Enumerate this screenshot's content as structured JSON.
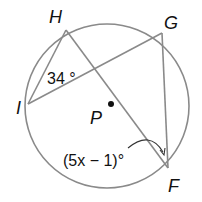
{
  "diagram": {
    "type": "circle-inscribed-angles",
    "circle": {
      "center": "P",
      "cx": 107,
      "cy": 106,
      "r": 82
    },
    "points": {
      "H": {
        "label": "H",
        "x": 66,
        "y": 30
      },
      "G": {
        "label": "G",
        "x": 162,
        "y": 33
      },
      "I": {
        "label": "I",
        "x": 28,
        "y": 104
      },
      "F": {
        "label": "F",
        "x": 168,
        "y": 168
      },
      "P": {
        "label": "P",
        "x": 111,
        "y": 104
      }
    },
    "segments": [
      "HI",
      "HF",
      "IG",
      "GF"
    ],
    "angle_labels": {
      "at_I": "34 °",
      "at_F": "(5x − 1)°"
    },
    "colors": {
      "stroke": "#8a8a8a",
      "text": "#111111"
    }
  }
}
